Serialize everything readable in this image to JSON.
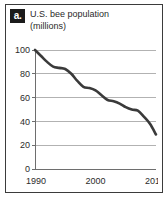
{
  "figure": {
    "badge_label": "a.",
    "title_line1": "U.S. bee population",
    "title_line2": "(millions)"
  },
  "colors": {
    "frame_border": "#3b3b3b",
    "badge_background": "#1b1b1b",
    "badge_text": "#ffffff",
    "gridline": "#b2b2b2",
    "axis": "#6e6e6e",
    "data_line": "#3a3a3a",
    "text": "#2a2a2a",
    "background": "#ffffff"
  },
  "chart_data": {
    "type": "line",
    "title": "U.S. bee population (millions)",
    "xlabel": "",
    "ylabel": "",
    "xlim": [
      1990,
      2010
    ],
    "ylim": [
      0,
      100
    ],
    "ytick_labels": [
      "100",
      "80",
      "60",
      "40",
      "20",
      "0"
    ],
    "yticks": [
      100,
      80,
      60,
      40,
      20,
      0
    ],
    "xtick_labels": [
      "1990",
      "2000",
      "2010"
    ],
    "xticks": [
      1990,
      2000,
      2010
    ],
    "grid": true,
    "legend": null,
    "series": [
      {
        "name": "U.S. bee population",
        "x": [
          1990,
          1991,
          1992,
          1993,
          1994,
          1995,
          1996,
          1997,
          1998,
          1999,
          2000,
          2001,
          2002,
          2003,
          2004,
          2005,
          2006,
          2007,
          2008,
          2009,
          2010
        ],
        "values": [
          100,
          95,
          90,
          86,
          85,
          84,
          80,
          74,
          69,
          68,
          66,
          62,
          58,
          57,
          55,
          52,
          50,
          49,
          44,
          38,
          29
        ]
      }
    ]
  }
}
